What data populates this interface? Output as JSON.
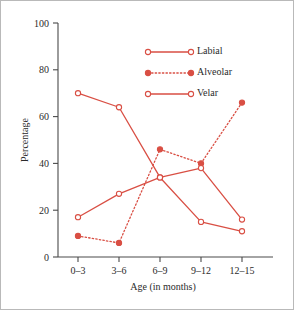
{
  "chart_data": {
    "type": "line",
    "title": "",
    "xlabel": "Age (in months)",
    "ylabel": "Percentage",
    "categories": [
      "0–3",
      "3–6",
      "6–9",
      "9–12",
      "12–15"
    ],
    "ylim": [
      0,
      100
    ],
    "yticks": [
      0,
      20,
      40,
      60,
      80,
      100
    ],
    "ytick_labels": [
      "0",
      "20",
      "40",
      "60",
      "80",
      "100"
    ],
    "grid": false,
    "legend_position": "upper-right-inside",
    "accent_color": "#d94f44",
    "axis_color": "#4a4a4a",
    "series": [
      {
        "name": "Labial",
        "values": [
          70,
          64,
          34,
          15,
          11
        ],
        "line_style": "solid",
        "marker": "open-circle",
        "color": "#d94f44"
      },
      {
        "name": "Alveolar",
        "values": [
          9,
          6,
          46,
          40,
          66
        ],
        "line_style": "dotted",
        "marker": "filled-circle",
        "color": "#d94f44"
      },
      {
        "name": "Velar",
        "values": [
          17,
          27,
          34,
          38,
          16
        ],
        "line_style": "solid",
        "marker": "open-circle",
        "color": "#d94f44"
      }
    ]
  },
  "legend": {
    "entries": [
      {
        "label": "Labial"
      },
      {
        "label": "Alveolar"
      },
      {
        "label": "Velar"
      }
    ]
  }
}
